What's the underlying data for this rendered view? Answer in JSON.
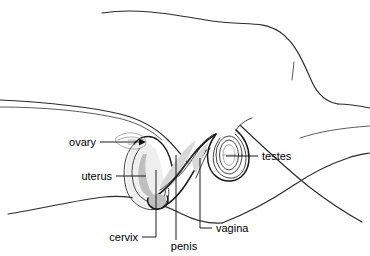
{
  "figure": {
    "kind": "anatomical-line-drawing",
    "background_color": "#ffffff",
    "line_color": "#2b2b2b",
    "organ_line_color": "#171717",
    "shade_color": "#d8d8d8",
    "label_color": "#000000",
    "label_font_size": "11px"
  },
  "labels": [
    {
      "id": "ovary",
      "text": "ovary",
      "text_x": 96,
      "text_y": 146,
      "anchor": "end",
      "leader": "M 100 142 L 142 142",
      "has_arrowhead": true,
      "arrow_x": 146,
      "arrow_y": 142
    },
    {
      "id": "uterus",
      "text": "uterus",
      "text_x": 112,
      "text_y": 180,
      "anchor": "end",
      "leader": "M 116 176 L 146 176",
      "has_arrowhead": false
    },
    {
      "id": "cervix",
      "text": "cervix",
      "text_x": 138,
      "text_y": 241,
      "anchor": "end",
      "leader": "M 142 237 L 156 237 L 156 170",
      "has_arrowhead": false
    },
    {
      "id": "penis",
      "text": "penis",
      "text_x": 184,
      "text_y": 250,
      "anchor": "middle",
      "leader": "M 176 240 L 176 155",
      "has_arrowhead": false
    },
    {
      "id": "vagina",
      "text": "vagina",
      "text_x": 216,
      "text_y": 232,
      "anchor": "start",
      "leader": "M 212 228 L 200 228 L 200 158",
      "has_arrowhead": false
    },
    {
      "id": "testes",
      "text": "testes",
      "text_x": 262,
      "text_y": 160,
      "anchor": "start",
      "leader": "M 258 156 L 226 156",
      "has_arrowhead": false
    }
  ]
}
